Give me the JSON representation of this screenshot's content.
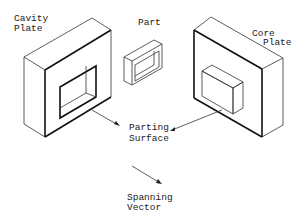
{
  "labels": {
    "cavity_plate": [
      "Cavity",
      "Plate"
    ],
    "part": "Part",
    "core_plate": [
      "Core",
      "Plate"
    ],
    "parting_surface": [
      "Parting",
      "Surface"
    ],
    "spanning_vector": [
      "Spanning",
      "Vector"
    ]
  },
  "colors": {
    "line": "#111111",
    "background": "#ffffff"
  }
}
